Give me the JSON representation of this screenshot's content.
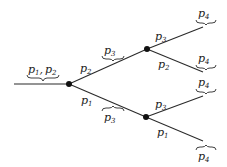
{
  "diagram": {
    "type": "binary-tree",
    "colors": {
      "stroke": "#2a2a2a",
      "node": "#111111",
      "background": "#ffffff"
    },
    "root_input": {
      "label_base1": "p",
      "sub1": "1",
      "sep": ",",
      "label_base2": "p",
      "sub2": "2",
      "text": "p1, p2"
    },
    "nodes": [
      {
        "id": "n0",
        "x": 69,
        "y": 84
      },
      {
        "id": "n1",
        "x": 147,
        "y": 49
      },
      {
        "id": "n2",
        "x": 146,
        "y": 117
      }
    ],
    "edge_labels": {
      "n0_up": {
        "base": "p",
        "sub": "2"
      },
      "n0_down": {
        "base": "p",
        "sub": "1"
      },
      "n0_up_brace": {
        "base": "p",
        "sub": "3"
      },
      "n0_down_brace": {
        "base": "p",
        "sub": "3"
      },
      "n1_up": {
        "base": "p",
        "sub": "3"
      },
      "n1_down": {
        "base": "p",
        "sub": "2"
      },
      "n2_up": {
        "base": "p",
        "sub": "3"
      },
      "n2_down": {
        "base": "p",
        "sub": "1"
      }
    },
    "leaf_labels": [
      {
        "base": "p",
        "sub": "4"
      },
      {
        "base": "p",
        "sub": "4"
      },
      {
        "base": "p",
        "sub": "4"
      },
      {
        "base": "p",
        "sub": "4"
      }
    ]
  }
}
